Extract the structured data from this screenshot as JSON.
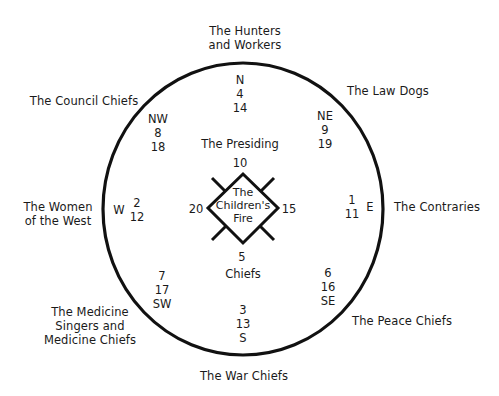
{
  "diagram": {
    "colors": {
      "stroke": "#111111",
      "text": "#1a1a1a",
      "background": "#ffffff"
    },
    "outer_labels": {
      "north": [
        "The Hunters",
        "and Workers"
      ],
      "northeast": [
        "The Law Dogs"
      ],
      "east": [
        "The Contraries"
      ],
      "southeast": [
        "The Peace Chiefs"
      ],
      "south": [
        "The War Chiefs"
      ],
      "southwest": [
        "The Medicine",
        "Singers and",
        "Medicine Chiefs"
      ],
      "west": [
        "The Women",
        "of the West"
      ],
      "northwest": [
        "The Council Chiefs"
      ]
    },
    "directions": {
      "N": {
        "label": "N",
        "numbers": [
          "4",
          "14"
        ]
      },
      "NE": {
        "label": "NE",
        "numbers": [
          "9",
          "19"
        ]
      },
      "E": {
        "label": "E",
        "numbers": [
          "1",
          "11"
        ]
      },
      "SE": {
        "label": "SE",
        "numbers": [
          "6",
          "16"
        ]
      },
      "S": {
        "label": "S",
        "numbers": [
          "3",
          "13"
        ]
      },
      "SW": {
        "label": "SW",
        "numbers": [
          "7",
          "17"
        ]
      },
      "W": {
        "label": "W",
        "numbers": [
          "2",
          "12"
        ]
      },
      "NW": {
        "label": "NW",
        "numbers": [
          "8",
          "18"
        ]
      }
    },
    "center": {
      "fire_label": [
        "The",
        "Children's",
        "Fire"
      ],
      "top_caption": "The Presiding",
      "bottom_caption": "Chiefs",
      "top_number": "10",
      "right_number": "15",
      "bottom_number": "5",
      "left_number": "20"
    }
  }
}
